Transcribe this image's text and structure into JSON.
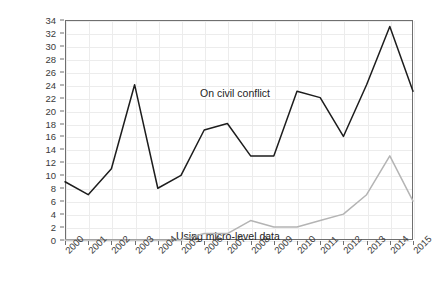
{
  "chart_data": {
    "type": "line",
    "title": "",
    "xlabel": "",
    "ylabel": "Total articles",
    "categories": [
      "2000",
      "2001",
      "2002",
      "2003",
      "2004",
      "2005",
      "2006",
      "2007",
      "2008",
      "2009",
      "2010",
      "2011",
      "2012",
      "2013",
      "2014",
      "2015"
    ],
    "ylim": [
      0,
      34
    ],
    "ytick_step": 2,
    "yticks": [
      "0",
      "2",
      "4",
      "6",
      "8",
      "10",
      "12",
      "14",
      "16",
      "18",
      "20",
      "22",
      "24",
      "26",
      "28",
      "30",
      "32",
      "34"
    ],
    "grid": true,
    "legend_position": "inline-annotations",
    "series": [
      {
        "name": "On civil conflict",
        "color": "#1d1d1d",
        "values": [
          9,
          7,
          11,
          24,
          8,
          10,
          17,
          18,
          13,
          13,
          23,
          22,
          16,
          24,
          33,
          23
        ]
      },
      {
        "name": "Using micro-level data",
        "color": "#b4b4b4",
        "values": [
          0,
          0,
          0,
          0,
          0,
          0,
          1,
          1,
          3,
          2,
          2,
          3,
          4,
          7,
          13,
          6
        ]
      }
    ],
    "annotations": [
      {
        "text": "On civil conflict",
        "series": "On civil conflict"
      },
      {
        "text": "Using micro-level data",
        "series": "Using micro-level data"
      }
    ]
  },
  "axes": {
    "y_title": "Total articles"
  }
}
